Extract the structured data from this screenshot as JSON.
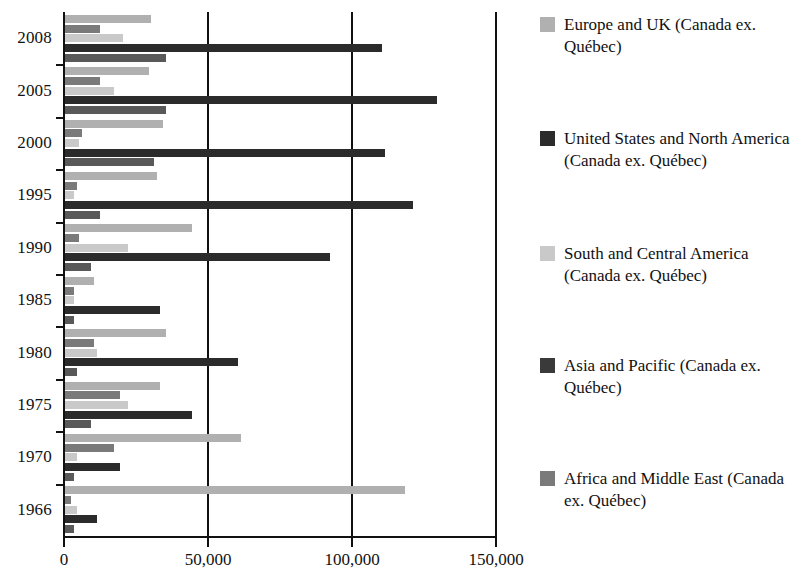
{
  "chart_data": {
    "type": "bar",
    "orientation": "horizontal",
    "title": "",
    "subtitle": "",
    "xlabel": "",
    "ylabel": "",
    "xlim": [
      0,
      150000
    ],
    "xticks": [
      0,
      50000,
      100000,
      150000
    ],
    "xtick_labels": [
      "0",
      "50,000",
      "100,000",
      "150,000"
    ],
    "grid": "vertical",
    "legend_position": "right",
    "categories": [
      "2008",
      "2005",
      "2000",
      "1995",
      "1990",
      "1985",
      "1980",
      "1975",
      "1970",
      "1966"
    ],
    "series": [
      {
        "name": "Europe and UK (Canada ex. Québec)",
        "color": "#b0b0b0",
        "values": [
          30000,
          29000,
          34000,
          32000,
          44000,
          10000,
          35000,
          33000,
          61000,
          118000
        ]
      },
      {
        "name": "Africa and Middle East (Canada ex. Québec)",
        "color": "#7a7a7a",
        "values": [
          12000,
          12000,
          6000,
          4000,
          5000,
          3000,
          10000,
          19000,
          17000,
          2000
        ]
      },
      {
        "name": "South and Central America (Canada ex. Québec)",
        "color": "#c9c9c9",
        "values": [
          20000,
          17000,
          5000,
          3000,
          22000,
          3000,
          11000,
          22000,
          4000,
          4000
        ]
      },
      {
        "name": "United States and North America (Canada ex. Québec)",
        "color": "#2b2b2b",
        "values": [
          110000,
          129000,
          111000,
          121000,
          92000,
          33000,
          60000,
          44000,
          19000,
          11000
        ]
      },
      {
        "name": "Asia and Pacific (Canada ex. Québec)",
        "color": "#595959",
        "values": [
          35000,
          35000,
          31000,
          12000,
          9000,
          3000,
          4000,
          9000,
          3000,
          3000
        ]
      }
    ],
    "legend_entries": [
      {
        "label": "Europe and UK (Canada ex. Québec)",
        "color": "#b0b0b0"
      },
      {
        "label": "United States and North America (Canada ex. Québec)",
        "color": "#2b2b2b"
      },
      {
        "label": "South and Central America (Canada ex. Québec)",
        "color": "#c9c9c9"
      },
      {
        "label": "Asia and Pacific (Canada ex. Québec)",
        "color": "#3a3a3a"
      },
      {
        "label": "Africa and Middle East (Canada ex. Québec)",
        "color": "#7a7a7a"
      }
    ]
  }
}
